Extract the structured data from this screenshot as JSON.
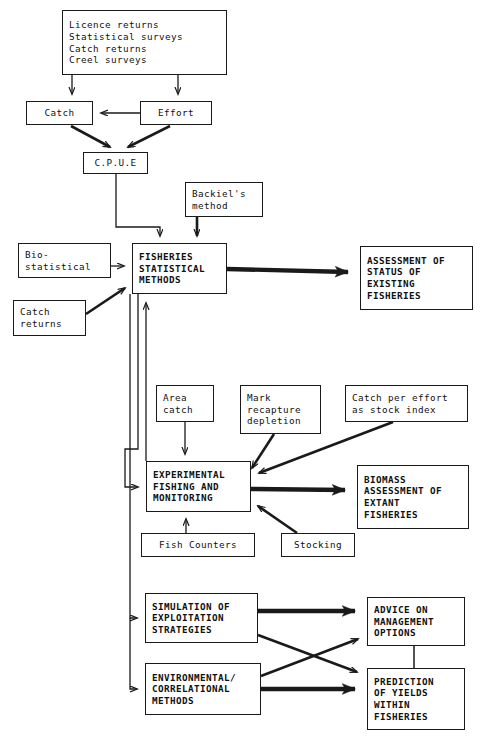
{
  "diagram": {
    "background": "#ffffff",
    "stroke": "#1a1a1a",
    "width": 491,
    "height": 737
  },
  "nodes": {
    "sources": {
      "id": "sources",
      "lines": [
        "Licence returns",
        "Statistical surveys",
        "Catch returns",
        "Creel surveys"
      ],
      "bold": false,
      "x": 62,
      "y": 10,
      "w": 165,
      "h": 65
    },
    "catch": {
      "id": "catch",
      "lines": [
        "Catch"
      ],
      "bold": false,
      "x": 26,
      "y": 101,
      "w": 67,
      "h": 24
    },
    "effort": {
      "id": "effort",
      "lines": [
        "Effort"
      ],
      "bold": false,
      "x": 140,
      "y": 101,
      "w": 72,
      "h": 24
    },
    "cpue": {
      "id": "cpue",
      "lines": [
        "C.P.U.E"
      ],
      "bold": false,
      "x": 83,
      "y": 152,
      "w": 65,
      "h": 22
    },
    "backiel": {
      "id": "backiel",
      "lines": [
        "Backiel's",
        "method"
      ],
      "bold": false,
      "x": 185,
      "y": 182,
      "w": 78,
      "h": 35
    },
    "biostatistical": {
      "id": "biostatistical",
      "lines": [
        "Bio-",
        "statistical"
      ],
      "bold": false,
      "x": 18,
      "y": 243,
      "w": 93,
      "h": 35
    },
    "catch_returns": {
      "id": "catch_returns",
      "lines": [
        "Catch",
        "returns"
      ],
      "bold": false,
      "x": 13,
      "y": 300,
      "w": 73,
      "h": 36
    },
    "fisheries_methods": {
      "id": "fisheries_methods",
      "lines": [
        "FISHERIES",
        "STATISTICAL",
        "METHODS"
      ],
      "bold": true,
      "x": 132,
      "y": 243,
      "w": 95,
      "h": 51
    },
    "assessment_status": {
      "id": "assessment_status",
      "lines": [
        "ASSESSMENT OF",
        "STATUS OF",
        "EXISTING",
        "FISHERIES"
      ],
      "bold": true,
      "x": 360,
      "y": 246,
      "w": 113,
      "h": 64
    },
    "area_catch": {
      "id": "area_catch",
      "lines": [
        "Area",
        "catch"
      ],
      "bold": false,
      "x": 156,
      "y": 385,
      "w": 58,
      "h": 37
    },
    "mark_recapture": {
      "id": "mark_recapture",
      "lines": [
        "Mark",
        "recapture",
        "depletion"
      ],
      "bold": false,
      "x": 240,
      "y": 385,
      "w": 81,
      "h": 49
    },
    "catch_per_effort": {
      "id": "catch_per_effort",
      "lines": [
        "Catch per effort",
        "as stock index"
      ],
      "bold": false,
      "x": 345,
      "y": 385,
      "w": 123,
      "h": 37
    },
    "experimental_fishing": {
      "id": "experimental_fishing",
      "lines": [
        "EXPERIMENTAL",
        "FISHING AND",
        "MONITORING"
      ],
      "bold": true,
      "x": 146,
      "y": 461,
      "w": 105,
      "h": 51
    },
    "biomass_assessment": {
      "id": "biomass_assessment",
      "lines": [
        "BIOMASS",
        "ASSESSMENT OF",
        "EXTANT",
        "FISHERIES"
      ],
      "bold": true,
      "x": 357,
      "y": 465,
      "w": 112,
      "h": 64
    },
    "fish_counters": {
      "id": "fish_counters",
      "lines": [
        "Fish Counters"
      ],
      "bold": false,
      "x": 141,
      "y": 533,
      "w": 114,
      "h": 24
    },
    "stocking": {
      "id": "stocking",
      "lines": [
        "Stocking"
      ],
      "bold": false,
      "x": 281,
      "y": 533,
      "w": 74,
      "h": 24
    },
    "simulation": {
      "id": "simulation",
      "lines": [
        "SIMULATION OF",
        "EXPLOITATION",
        "STRATEGIES"
      ],
      "bold": true,
      "x": 145,
      "y": 593,
      "w": 113,
      "h": 50
    },
    "environmental": {
      "id": "environmental",
      "lines": [
        "ENVIRONMENTAL/",
        "CORRELATIONAL",
        "METHODS"
      ],
      "bold": true,
      "x": 145,
      "y": 663,
      "w": 116,
      "h": 52
    },
    "advice_management": {
      "id": "advice_management",
      "lines": [
        "ADVICE ON",
        "MANAGEMENT",
        "OPTIONS"
      ],
      "bold": true,
      "x": 367,
      "y": 597,
      "w": 98,
      "h": 49
    },
    "prediction_yields": {
      "id": "prediction_yields",
      "lines": [
        "PREDICTION",
        "OF YIELDS",
        "WITHIN",
        "FISHERIES"
      ],
      "bold": true,
      "x": 367,
      "y": 668,
      "w": 98,
      "h": 62
    }
  },
  "edges": [
    {
      "name": "sources-to-catch",
      "from": "sources",
      "to": "catch",
      "weight": "thin"
    },
    {
      "name": "sources-to-effort",
      "from": "sources",
      "to": "effort",
      "weight": "thin"
    },
    {
      "name": "effort-to-catch",
      "from": "effort",
      "to": "catch",
      "weight": "thin"
    },
    {
      "name": "catch-to-cpue",
      "from": "catch",
      "to": "cpue",
      "weight": "thick"
    },
    {
      "name": "effort-to-cpue",
      "from": "effort",
      "to": "cpue",
      "weight": "thick"
    },
    {
      "name": "cpue-to-fisheries-methods",
      "from": "cpue",
      "to": "fisheries_methods",
      "weight": "thin"
    },
    {
      "name": "backiel-to-fisheries-methods",
      "from": "backiel",
      "to": "fisheries_methods",
      "weight": "thick"
    },
    {
      "name": "biostatistical-to-fisheries-methods",
      "from": "biostatistical",
      "to": "fisheries_methods",
      "weight": "thin"
    },
    {
      "name": "catch-returns-to-fisheries-methods",
      "from": "catch_returns",
      "to": "fisheries_methods",
      "weight": "thick"
    },
    {
      "name": "fisheries-methods-to-assessment-status",
      "from": "fisheries_methods",
      "to": "assessment_status",
      "weight": "thick"
    },
    {
      "name": "experimental-fishing-to-fisheries-methods",
      "from": "experimental_fishing",
      "to": "fisheries_methods",
      "weight": "thin"
    },
    {
      "name": "fisheries-methods-to-experimental-fishing",
      "from": "fisheries_methods",
      "to": "experimental_fishing",
      "weight": "thin"
    },
    {
      "name": "fisheries-methods-to-simulation",
      "from": "fisheries_methods",
      "to": "simulation",
      "weight": "thin"
    },
    {
      "name": "fisheries-methods-to-environmental",
      "from": "fisheries_methods",
      "to": "environmental",
      "weight": "thin"
    },
    {
      "name": "area-catch-to-experimental-fishing",
      "from": "area_catch",
      "to": "experimental_fishing",
      "weight": "thin"
    },
    {
      "name": "mark-recapture-to-experimental-fishing",
      "from": "mark_recapture",
      "to": "experimental_fishing",
      "weight": "thick"
    },
    {
      "name": "catch-per-effort-to-experimental-fishing",
      "from": "catch_per_effort",
      "to": "experimental_fishing",
      "weight": "thick"
    },
    {
      "name": "fish-counters-to-experimental-fishing",
      "from": "fish_counters",
      "to": "experimental_fishing",
      "weight": "thin"
    },
    {
      "name": "stocking-to-experimental-fishing",
      "from": "stocking",
      "to": "experimental_fishing",
      "weight": "thick"
    },
    {
      "name": "experimental-fishing-to-biomass-assessment",
      "from": "experimental_fishing",
      "to": "biomass_assessment",
      "weight": "thick"
    },
    {
      "name": "simulation-to-advice-management",
      "from": "simulation",
      "to": "advice_management",
      "weight": "thick"
    },
    {
      "name": "simulation-to-prediction-yields",
      "from": "simulation",
      "to": "prediction_yields",
      "weight": "thick"
    },
    {
      "name": "environmental-to-advice-management",
      "from": "environmental",
      "to": "advice_management",
      "weight": "thick"
    },
    {
      "name": "environmental-to-prediction-yields",
      "from": "environmental",
      "to": "prediction_yields",
      "weight": "thick"
    },
    {
      "name": "advice-management-to-prediction-yields",
      "from": "advice_management",
      "to": "prediction_yields",
      "weight": "plain"
    }
  ]
}
